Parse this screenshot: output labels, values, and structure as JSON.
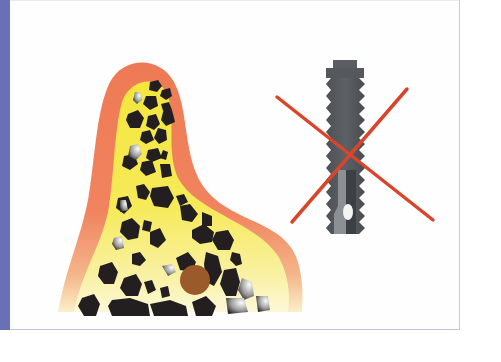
{
  "figure": {
    "colors": {
      "side_bar": "#6a70b6",
      "panel_border": "#c4c7e0",
      "gingiva": "#ee7a55",
      "gingiva_fade": "#f7d6a0",
      "cortical_bone": "#f5e84a",
      "cortical_bone_light": "#fbf7c8",
      "trabecular_cells": "#231f20",
      "nerve_canal": "#9b5a2a",
      "implant_dark": "#55595e",
      "implant_light": "#8b9095",
      "cross_mark": "#d9452a"
    },
    "elements": [
      {
        "name": "bone-ridge",
        "label": "Narrow alveolar ridge (cross-section)"
      },
      {
        "name": "nerve-canal",
        "label": "Canal (brown circle)"
      },
      {
        "name": "dental-implant",
        "label": "Threaded dental implant"
      },
      {
        "name": "cross-mark",
        "label": "Red X — not suitable"
      }
    ]
  }
}
